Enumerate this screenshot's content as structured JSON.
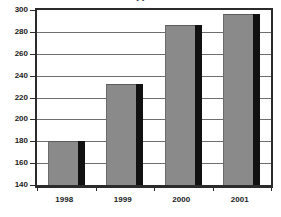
{
  "chart_data": {
    "type": "bar",
    "title": "",
    "subtitle": "",
    "xlabel": "",
    "ylabel": "",
    "categories": [
      "1998",
      "1999",
      "2000",
      "2001"
    ],
    "values": [
      180,
      232,
      286,
      296
    ],
    "series": [
      {
        "name": "",
        "values": [
          180,
          232,
          286,
          296
        ]
      }
    ],
    "ylim": [
      140,
      300
    ],
    "ytick_labels": [
      "300",
      "280",
      "260",
      "240",
      "220",
      "200",
      "180",
      "160",
      "140"
    ],
    "ytick_values": [
      300,
      280,
      260,
      240,
      220,
      200,
      180,
      160,
      140
    ],
    "ytick_step": 20,
    "grid": true,
    "grid_axis": "y",
    "legend": false,
    "legend_position": "none",
    "bar_style": "3d-shadow",
    "colors": {
      "bar_fill": "#8a8a8a",
      "bar_shadow": "#111111",
      "gridline": "#6e6e6e",
      "axis": "#2b2b2b",
      "plot_background": "#ffffff",
      "text": "#1c1c1c"
    }
  },
  "title_strip": {
    "clipped_title": "(  )"
  }
}
